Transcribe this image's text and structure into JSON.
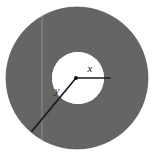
{
  "figure": {
    "name": "annulus-radius-diagram",
    "type": "geometric-diagram",
    "background_color": "#ffffff",
    "ring_fill_color": "#5a5a5a",
    "hole_fill_color": "#ffffff",
    "line_color": "#1a1a1a",
    "outer_circle": {
      "center_x": 77,
      "center_y": 78,
      "radius": 71
    },
    "inner_circle": {
      "center_x": 78,
      "center_y": 78,
      "radius": 26
    },
    "center_point": {
      "x": 76,
      "y": 78,
      "radius": 2
    },
    "radius_x": {
      "label": "x",
      "from_x": 76,
      "from_y": 78,
      "to_x": 110,
      "to_y": 78,
      "label_x": 90,
      "label_y": 72
    },
    "radius_y": {
      "label": "y",
      "from_x": 76,
      "from_y": 78,
      "to_x": 32,
      "to_y": 131,
      "label_x": 57,
      "label_y": 94
    },
    "scan_line": {
      "x": 42,
      "from_y": 14,
      "to_y": 142
    }
  }
}
